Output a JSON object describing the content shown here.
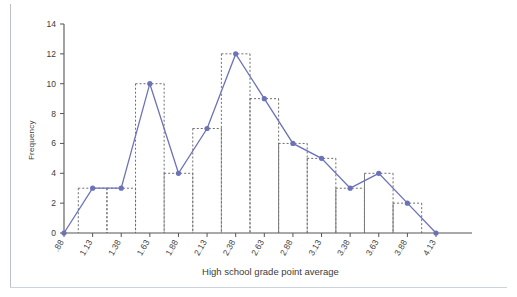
{
  "chart_data": {
    "type": "line",
    "title": "",
    "subtitle": "",
    "xlabel": "High school grade point average",
    "ylabel": "Frequency",
    "categories": [
      ".88",
      "1.13",
      "1.38",
      "1.63",
      "1.88",
      "2.13",
      "2.38",
      "2.63",
      "2.88",
      "3.13",
      "3.38",
      "3.63",
      "3.88",
      "4.13"
    ],
    "values": [
      0,
      3,
      3,
      10,
      4,
      7,
      12,
      9,
      6,
      5,
      3,
      4,
      2,
      0
    ],
    "series": [
      {
        "name": "Frequency",
        "values": [
          0,
          3,
          3,
          10,
          4,
          7,
          12,
          9,
          6,
          5,
          3,
          4,
          2,
          0
        ]
      }
    ],
    "yticks": [
      0,
      2,
      4,
      6,
      8,
      10,
      12,
      14
    ],
    "ylim": [
      0,
      14
    ],
    "grid": false,
    "legend": "none",
    "overlay": "histogram-bars-dashed",
    "line_color": "#6b72b8",
    "marker_color": "#6b72b8",
    "bar_outline_color": "#808080",
    "axis_color": "#555555",
    "background": "#ffffff"
  },
  "axes": {
    "y_title": "Frequency",
    "x_title": "High school grade point average",
    "y_tick_labels": [
      "0",
      "2",
      "4",
      "6",
      "8",
      "10",
      "12",
      "14"
    ],
    "x_tick_labels": [
      ".88",
      "1.13",
      "1.38",
      "1.63",
      "1.88",
      "2.13",
      "2.38",
      "2.63",
      "2.88",
      "3.13",
      "3.38",
      "3.63",
      "3.88",
      "4.13"
    ]
  }
}
